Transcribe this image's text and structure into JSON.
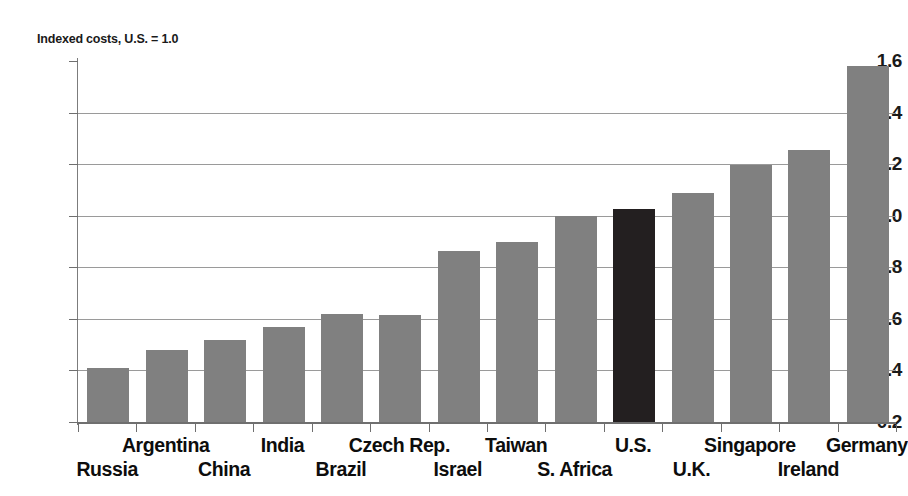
{
  "chart_data": {
    "type": "bar",
    "title": "Indexed costs, U.S. = 1.0",
    "xlabel": "",
    "ylabel": "Indexed costs, U.S. = 1.0",
    "ylim": [
      0.2,
      1.6
    ],
    "ytick_step": 0.2,
    "grid": true,
    "legend": "none",
    "highlight_category": "U.S.",
    "colors": {
      "bar": "#808080",
      "highlight_bar": "#231f20",
      "gridline": "#9a9a9a",
      "axis": "#6f6f6f",
      "text": "#0d0d0d",
      "background": "#ffffff"
    },
    "categories": [
      "Russia",
      "Argentina",
      "China",
      "India",
      "Brazil",
      "Czech Rep.",
      "Israel",
      "Taiwan",
      "S. Africa",
      "U.S.",
      "U.K.",
      "Singapore",
      "Ireland",
      "Germany"
    ],
    "values": [
      0.41,
      0.48,
      0.52,
      0.57,
      0.62,
      0.615,
      0.865,
      0.9,
      1.0,
      1.025,
      1.09,
      1.195,
      1.255,
      1.58
    ],
    "ytick_labels": [
      "1.6",
      "1.4",
      "1.2",
      "1.0",
      "0.8",
      "0.6",
      "0.4",
      "0.2"
    ],
    "ytick_values": [
      1.6,
      1.4,
      1.2,
      1.0,
      0.8,
      0.6,
      0.4,
      0.2
    ],
    "label_rows": [
      "bottom",
      "top",
      "bottom",
      "top",
      "bottom",
      "top",
      "bottom",
      "top",
      "bottom",
      "top",
      "bottom",
      "top",
      "bottom",
      "top"
    ]
  }
}
